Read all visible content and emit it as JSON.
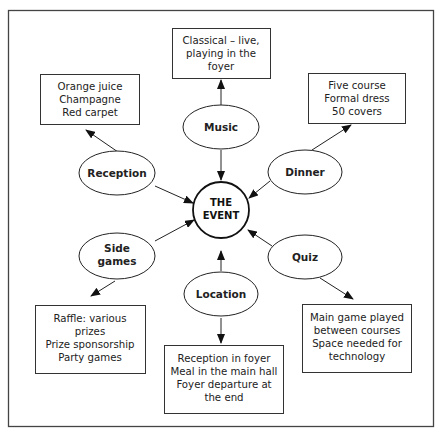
{
  "diagram": {
    "type": "mind-map",
    "center": {
      "label_lines": [
        "THE",
        "EVENT"
      ]
    },
    "nodes": {
      "music": {
        "label_lines": [
          "Music"
        ],
        "details": [
          "Classical – live,",
          "playing in the",
          "foyer"
        ]
      },
      "reception": {
        "label_lines": [
          "Reception"
        ],
        "details": [
          "Orange juice",
          "Champagne",
          "Red carpet"
        ]
      },
      "dinner": {
        "label_lines": [
          "Dinner"
        ],
        "details": [
          "Five course",
          "Formal dress",
          "50 covers"
        ]
      },
      "side_games": {
        "label_lines": [
          "Side",
          "games"
        ],
        "details": [
          "Raffle: various",
          "prizes",
          "Prize sponsorship",
          "Party games"
        ]
      },
      "quiz": {
        "label_lines": [
          "Quiz"
        ],
        "details": [
          "Main game played",
          "between courses",
          "Space needed for",
          "technology"
        ]
      },
      "location": {
        "label_lines": [
          "Location"
        ],
        "details": [
          "Reception in foyer",
          "Meal in the main hall",
          "Foyer departure at",
          "the end"
        ]
      }
    }
  }
}
